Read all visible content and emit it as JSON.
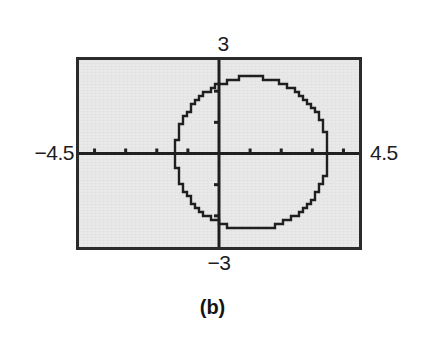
{
  "figure": {
    "caption": "(b)",
    "kind": "graphing-calculator-screen"
  },
  "labels": {
    "y_max": "3",
    "y_min": "−3",
    "x_min": "−4.5",
    "x_max": "4.5"
  },
  "colors": {
    "screen_background": "#e9e9e9",
    "frame_border": "#2b2b2b",
    "ink": "#1d1d1d",
    "curve": "#1f1f1f",
    "page_background": "#ffffff"
  },
  "chart_data": {
    "type": "scatter",
    "title": "",
    "subtitle": "",
    "xlabel": "",
    "ylabel": "",
    "xlim": [
      -4.5,
      4.5
    ],
    "ylim": [
      -3,
      3
    ],
    "grid": false,
    "legend": null,
    "x_tick_labels": [
      "−4.5",
      "4.5"
    ],
    "y_tick_labels": [
      "3",
      "−3"
    ],
    "x_tick_interval": 1,
    "y_tick_interval": 1,
    "x_ticks": [
      -4,
      -3,
      -2,
      -1,
      1,
      2,
      3,
      4
    ],
    "y_ticks": [
      -2,
      -1,
      1,
      2
    ],
    "axes_drawn": true,
    "annotations": [
      "(b)"
    ],
    "series": [
      {
        "name": "circle",
        "shape": "circle",
        "center": [
          1.05,
          0
        ],
        "radius": 2.45,
        "rendering": "pixelated-staircase",
        "stroke": "#1f1f1f",
        "stroke_width": 2.4
      }
    ]
  }
}
